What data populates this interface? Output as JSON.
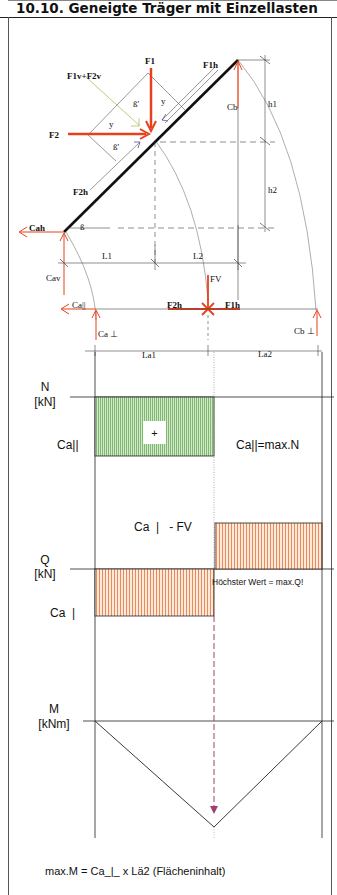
{
  "header": {
    "title": "10.10. Geneigte Träger mit Einzellasten"
  },
  "colors": {
    "force_red": "#e8401c",
    "beam_black": "#111111",
    "normal_fill_green": "#8cc080",
    "shear_fill_orange": "#f0a070",
    "dashed_purple": "#a04070",
    "guide_green": "#a8c060",
    "purple_arrow": "#5a4aa0"
  },
  "system_diagram": {
    "labels": {
      "f1": "F1",
      "f1v_f2v": "F1v+F2v",
      "f1h": "F1h",
      "f2": "F2",
      "f2h": "F2h",
      "beta_prime_1": "ß'",
      "beta_prime_2": "ß'",
      "gamma_1": "y",
      "gamma_2": "y",
      "beta": "ß",
      "cb": "Cb",
      "h1": "h1",
      "h2": "h2",
      "cah": "Cah",
      "cav": "Cav",
      "l1": "L1",
      "l2": "L2",
      "fv": "FV",
      "ca_parallel": "Ca||",
      "f2h_bottom": "F2h",
      "f1h_bottom": "F1h",
      "ca_perp": "Ca ⊥",
      "cb_perp": "Cb ⊥",
      "la1": "La1",
      "la2": "La2"
    }
  },
  "normal_force_diagram": {
    "axis_label": "N",
    "unit": "[kN]",
    "value_label": "Ca||",
    "sign": "+",
    "annotation": "Ca||=max.N"
  },
  "shear_force_diagram": {
    "axis_label": "Q",
    "unit": "[kN]",
    "upper_label": "Ca  |   - FV",
    "lower_label": "Ca  |",
    "annotation": "Höchster Wert = max.Q!"
  },
  "moment_diagram": {
    "axis_label": "M",
    "unit": "[kNm]",
    "formula": "max.M = Ca_|_ x Lä2 (Flächeninhalt)"
  }
}
